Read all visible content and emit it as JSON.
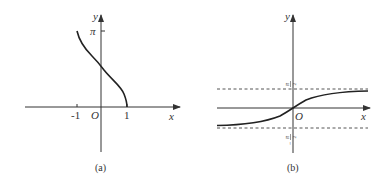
{
  "figures": [
    {
      "id": "a",
      "caption": "(a)",
      "function": "y = arccos x",
      "axis_labels": {
        "x": "x",
        "y": "y",
        "origin": "O"
      },
      "x_ticks": [
        "-1",
        "1"
      ],
      "y_ticks": [
        "π"
      ],
      "domain": [
        -1,
        1
      ],
      "range": [
        0,
        3.14159
      ]
    },
    {
      "id": "b",
      "caption": "(b)",
      "function": "y = arctan x",
      "axis_labels": {
        "x": "x",
        "y": "y",
        "origin": "O"
      },
      "asymptotes": [
        "π/2",
        "-π/2"
      ],
      "asymptote_labels": {
        "upper_num": "π",
        "upper_den": "2",
        "lower_sign": "−",
        "lower_num": "π",
        "lower_den": "2"
      }
    }
  ],
  "colors": {
    "axis": "#333333",
    "curve": "#222222",
    "dashed": "#555555"
  }
}
